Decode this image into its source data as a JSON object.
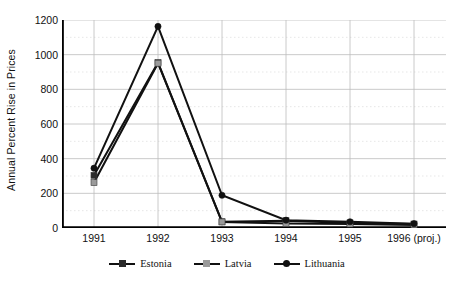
{
  "chart_data": {
    "type": "line",
    "title": "",
    "xlabel": "",
    "ylabel": "Annual Percent Rise in Prices",
    "categories": [
      "1991",
      "1992",
      "1993",
      "1994",
      "1995",
      "1996 (proj.)"
    ],
    "ylim": [
      0,
      1200
    ],
    "ytick_values": [
      0,
      200,
      400,
      600,
      800,
      1000,
      1200
    ],
    "ytick_labels": [
      "0",
      "200",
      "400",
      "600",
      "800",
      "1000",
      "1200"
    ],
    "minor_gridline_step": 100,
    "grid": "both",
    "legend_position": "bottom",
    "series": [
      {
        "name": "Estonia",
        "marker": "square",
        "color": "#2b2b2b",
        "values": [
          304,
          954,
          36,
          42,
          29,
          23
        ]
      },
      {
        "name": "Latvia",
        "marker": "square",
        "color": "#9a9a9a",
        "values": [
          262,
          951,
          35,
          26,
          23,
          18
        ]
      },
      {
        "name": "Lithuania",
        "marker": "circle",
        "color": "#111111",
        "values": [
          345,
          1163,
          189,
          45,
          36,
          25
        ]
      }
    ]
  },
  "legend": {
    "items": [
      {
        "label": "Estonia",
        "marker": "square-dark"
      },
      {
        "label": "Latvia",
        "marker": "square-light"
      },
      {
        "label": "Lithuania",
        "marker": "circle-dark"
      }
    ]
  },
  "colors": {
    "axis": "#000000",
    "gridline_major": "#bdbdbd",
    "gridline_minor": "#dcdcdc",
    "text": "#111111"
  }
}
